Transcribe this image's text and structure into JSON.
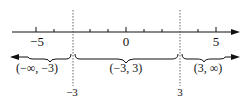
{
  "diagram": {
    "type": "number-line",
    "axis": {
      "min_tick": -5,
      "max_tick": 5,
      "tick_labels": [
        {
          "value": -5,
          "text": "−5"
        },
        {
          "value": 0,
          "text": "0"
        },
        {
          "value": 5,
          "text": "5"
        }
      ]
    },
    "critical_points": [
      {
        "value": -3,
        "label": "−3"
      },
      {
        "value": 3,
        "label": "3"
      }
    ],
    "intervals": [
      {
        "label": "(−∞, −3)"
      },
      {
        "label": "(−3, 3)"
      },
      {
        "label": "(3, ∞)"
      }
    ],
    "colors": {
      "ink": "#111111",
      "dashed": "#555555"
    }
  }
}
